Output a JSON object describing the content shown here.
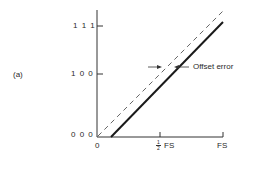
{
  "figure": {
    "panel_label": "(a)",
    "y_ticks": [
      {
        "label": "1 1 1",
        "code": "111"
      },
      {
        "label": "1 0 0",
        "code": "100"
      },
      {
        "label": "0 0 0",
        "code": "000"
      }
    ],
    "x_ticks": [
      {
        "label": "0"
      },
      {
        "label": "FS",
        "prefix_fraction": {
          "num": "1",
          "den": "2"
        }
      },
      {
        "label": "FS"
      }
    ],
    "annotation": "Offset error",
    "lines": [
      {
        "name": "ideal",
        "style": "dashed",
        "from": [
          0,
          0
        ],
        "to": [
          1,
          1
        ]
      },
      {
        "name": "actual",
        "style": "solid-thick",
        "from": [
          0.11,
          0
        ],
        "to": [
          1,
          0.9
        ]
      }
    ],
    "colors": {
      "ink": "#2a2a2a",
      "background": "#ffffff"
    }
  }
}
